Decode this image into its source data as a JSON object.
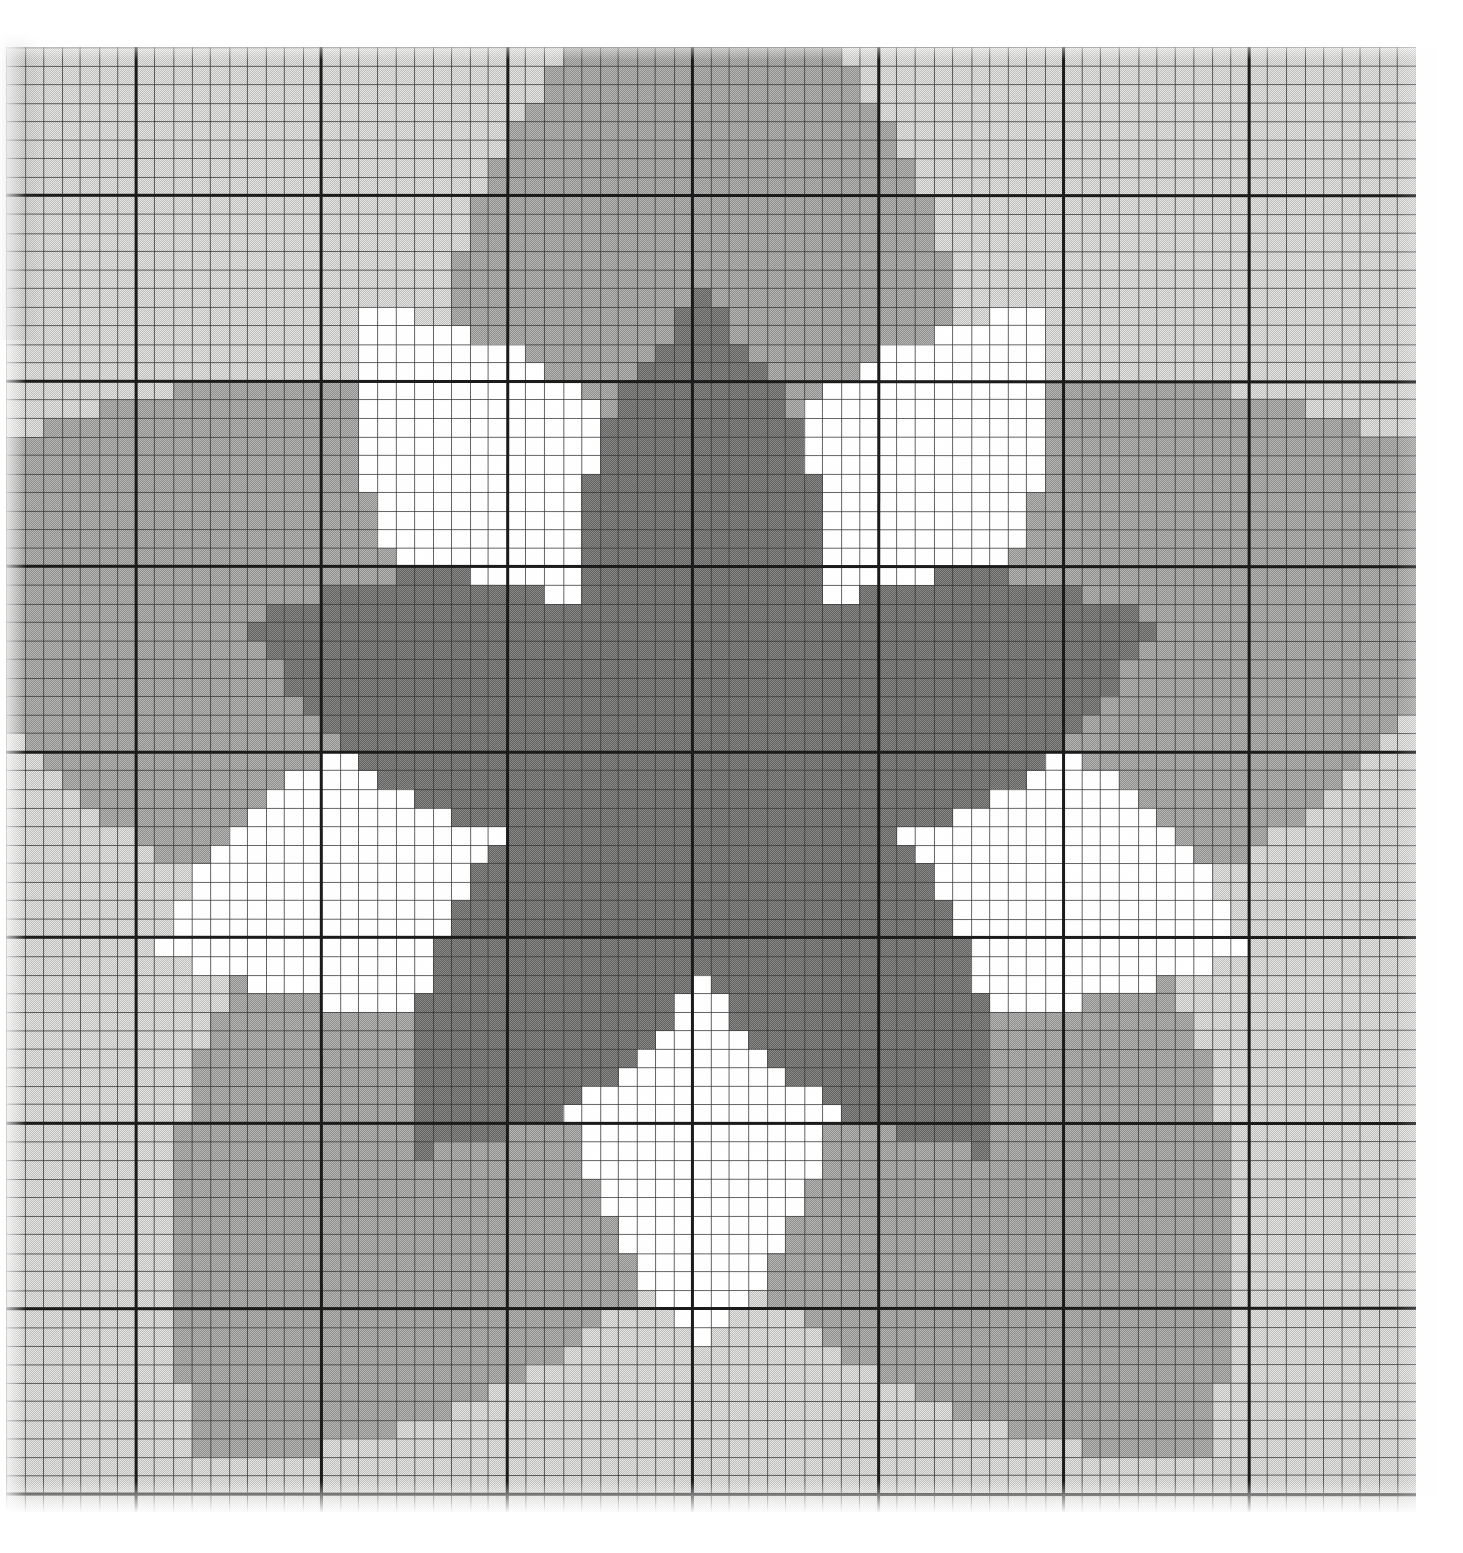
{
  "document": {
    "kind": "cross-stitch-pattern-chart",
    "title": "Five-Pointed Star Needlepoint Chart",
    "caption": ""
  },
  "paper": {
    "background_color": "#fefefe",
    "grid_line_color": "#3a3a3a",
    "grid_line_color_light": "#6e6e6e",
    "heavy_line_color": "#1b1b1b"
  },
  "grid": {
    "origin_x": 6,
    "origin_y": 47,
    "cell_size": 18.55,
    "cols": 76,
    "rows": 79,
    "heavy_every": 10,
    "heavy_offset_col": 7,
    "heavy_offset_row": 8,
    "light_line_width": 1,
    "heavy_line_width": 3
  },
  "palette": {
    "level_names": [
      "white",
      "light-gray",
      "medium-gray",
      "dark-gray"
    ],
    "colors": [
      "#ffffff",
      "#d8d8d6",
      "#a9a9a7",
      "#7c7c7a"
    ],
    "labels": [
      "blank / background fabric",
      "pale shade",
      "mid shade",
      "dark shade"
    ]
  },
  "chart_data": {
    "type": "heatmap",
    "subtitle": "",
    "xlabel": "",
    "ylabel": "",
    "grid": true,
    "legend": "none",
    "cols": 76,
    "rows": 79,
    "value_levels": [
      0,
      1,
      2,
      3
    ],
    "level_colors": [
      "#ffffff",
      "#d8d8d6",
      "#a9a9a7",
      "#7c7c7a"
    ],
    "star_geometry": {
      "center_col": 37.5,
      "center_row": 39.0,
      "point_up_angle_deg": -90,
      "num_points": 5,
      "dark_star_outer_radius_cells": 25.5,
      "dark_star_inner_radius_cells": 10.6,
      "white_star_outer_radius_cells": 31.0,
      "white_star_inner_radius_cells": 12.0,
      "white_star_rotation_deg": 36,
      "mid_field_outer_radius_cells": 46.0,
      "mid_field_inner_radius_cells": 24.0,
      "light_field_rotation_deg": 36
    }
  },
  "annotations": []
}
